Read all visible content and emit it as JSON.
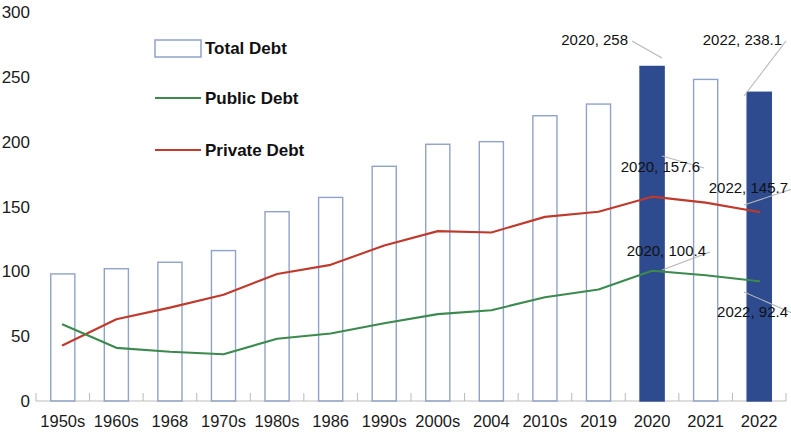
{
  "chart_data": {
    "type": "bar",
    "title": "",
    "subtitle": "",
    "xlabel": "",
    "ylabel": "",
    "ylim": [
      0,
      300
    ],
    "ytick_step": 50,
    "yticks": [
      "0",
      "50",
      "100",
      "150",
      "200",
      "250",
      "300"
    ],
    "grid": false,
    "legend_position": "upper-left-inside",
    "categories": [
      "1950s",
      "1960s",
      "1968",
      "1970s",
      "1980s",
      "1986",
      "1990s",
      "2000s",
      "2004",
      "2010s",
      "2019",
      "2020",
      "2021",
      "2022"
    ],
    "series": [
      {
        "name": "Total Debt",
        "type": "bar",
        "values": [
          98,
          102,
          107,
          116,
          146,
          157,
          181,
          198,
          200,
          220,
          229,
          258,
          248,
          238.1
        ],
        "color": "#8fa3c8",
        "fill": "none",
        "highlight_color": "#2d4b8e",
        "highlight_indices": [
          11,
          13
        ]
      },
      {
        "name": "Public Debt",
        "type": "line",
        "values": [
          59,
          41,
          38,
          36,
          48,
          52,
          60,
          67,
          70,
          80,
          86,
          100.4,
          97,
          92.4
        ],
        "color": "#3c8a4e"
      },
      {
        "name": "Private Debt",
        "type": "line",
        "values": [
          43,
          63,
          72,
          82,
          98,
          105,
          120,
          131,
          130,
          142,
          146,
          157.6,
          153,
          145.7
        ],
        "color": "#c0392b"
      }
    ],
    "annotations": [
      {
        "text": "2020, 258",
        "category": "2020",
        "series": "Total Debt",
        "value": 258
      },
      {
        "text": "2022, 238.1",
        "category": "2022",
        "series": "Total Debt",
        "value": 238.1
      },
      {
        "text": "2020, 157.6",
        "category": "2020",
        "series": "Private Debt",
        "value": 157.6
      },
      {
        "text": "2022, 145.7",
        "category": "2022",
        "series": "Private Debt",
        "value": 145.7
      },
      {
        "text": "2020, 100.4",
        "category": "2020",
        "series": "Public Debt",
        "value": 100.4
      },
      {
        "text": "2022, 92.4",
        "category": "2022",
        "series": "Public Debt",
        "value": 92.4
      }
    ]
  },
  "legend": {
    "items": [
      {
        "label": "Total Debt",
        "marker": "box-outline",
        "color": "#8fa3c8"
      },
      {
        "label": "Public Debt",
        "marker": "line",
        "color": "#3c8a4e"
      },
      {
        "label": "Private Debt",
        "marker": "line",
        "color": "#c0392b"
      }
    ]
  }
}
